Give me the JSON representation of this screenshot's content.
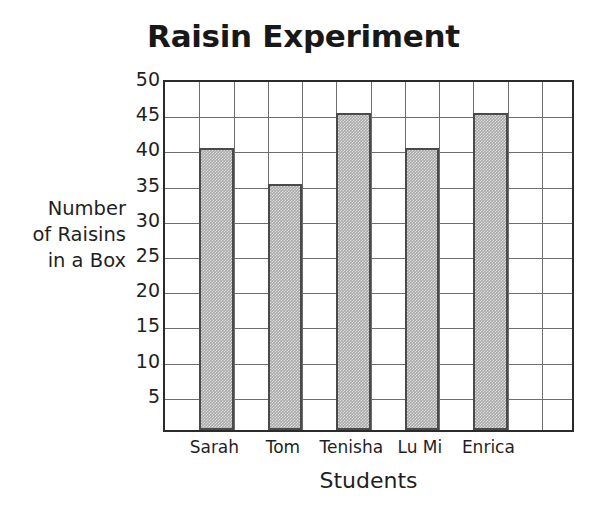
{
  "chart_data": {
    "type": "bar",
    "title": "Raisin Experiment",
    "xlabel": "Students",
    "ylabel": "Number\nof Raisins\nin a Box",
    "categories": [
      "Sarah",
      "Tom",
      "Tenisha",
      "Lu Mi",
      "Enrica"
    ],
    "values": [
      40,
      35,
      45,
      40,
      45
    ],
    "ylim": [
      0,
      50
    ],
    "yticks": [
      5,
      10,
      15,
      20,
      25,
      30,
      35,
      40,
      45,
      50
    ],
    "ytick_labels": [
      "5",
      "10",
      "15",
      "20",
      "25",
      "30",
      "35",
      "40",
      "45",
      "50"
    ],
    "grid": true,
    "grid_columns": 12,
    "grid_rows": 10,
    "legend": null,
    "series": [
      {
        "name": "Number of Raisins in a Box",
        "values": [
          40,
          35,
          45,
          40,
          45
        ],
        "bar_fill_color": "#a9a9a9",
        "bar_edge_color": "#4a4a4a"
      }
    ],
    "colors": {
      "background": "#ffffff",
      "axis": "#2b2b2b",
      "gridline": "#6e6e6e",
      "text": "#1f1f1f",
      "bar_fill": "#a9a9a9",
      "bar_edge": "#4a4a4a"
    }
  }
}
